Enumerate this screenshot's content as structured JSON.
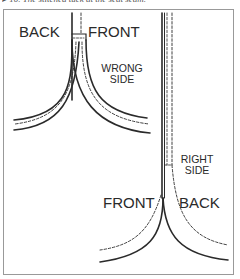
{
  "caption": "▸ 10. The stitched tuck at the seat seam.",
  "diagram": {
    "top_panel": {
      "left_label": "BACK",
      "right_label": "FRONT",
      "side_label_line1": "WRONG",
      "side_label_line2": "SIDE"
    },
    "bottom_panel": {
      "left_label": "FRONT",
      "right_label": "BACK",
      "side_label_line1": "RIGHT",
      "side_label_line2": "SIDE"
    },
    "colors": {
      "line": "#2a2a2a",
      "frame": "#999999",
      "background": "#ffffff"
    }
  }
}
